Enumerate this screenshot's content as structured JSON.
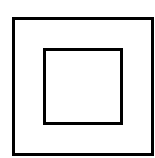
{
  "diagram": {
    "symbol": "double-insulation-class-ii",
    "background_color": "#ffffff",
    "stroke_color": "#000000",
    "outer_square": {
      "left": 12,
      "top": 17,
      "width": 142,
      "height": 139,
      "stroke_width": 3
    },
    "inner_square": {
      "left": 43,
      "top": 48,
      "width": 80,
      "height": 77,
      "stroke_width": 3
    }
  }
}
